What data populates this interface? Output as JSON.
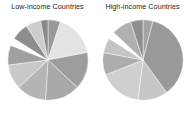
{
  "figure": {
    "background": "#ffffff",
    "text_color": "#1c1c1c"
  },
  "panels": [
    {
      "title": "Low-income Countries"
    },
    {
      "title": "High-income Countries"
    }
  ],
  "chart_data": [
    {
      "type": "pie",
      "title": "Low-income Countries",
      "xlabel": "",
      "ylabel": "",
      "legend": "none",
      "grid": false,
      "start_angle_deg": 90,
      "direction": "clockwise",
      "categories": [
        "Slice 1",
        "Slice 2",
        "Slice 3",
        "Slice 4",
        "Slice 5",
        "Slice 6",
        "Slice 7",
        "Slice 8",
        "Slice 9",
        "Slice 10",
        "Slice 11"
      ],
      "values": [
        5,
        17,
        15,
        14,
        12,
        10,
        8,
        3,
        7,
        6,
        3
      ],
      "colors": [
        "#9a9a9a",
        "#e3e3e3",
        "#9d9d9d",
        "#a9a9a9",
        "#b4b4b4",
        "#c9c9c9",
        "#a0a0a0",
        "#ffffff",
        "#8e8e8e",
        "#cdcdcd",
        "#8a8a8a"
      ]
    },
    {
      "type": "pie",
      "title": "High-income Countries",
      "xlabel": "",
      "ylabel": "",
      "legend": "none",
      "grid": false,
      "start_angle_deg": 90,
      "direction": "clockwise",
      "categories": [
        "Slice 1",
        "Slice 2",
        "Slice 3",
        "Slice 4",
        "Slice 5",
        "Slice 6",
        "Slice 7",
        "Slice 8",
        "Slice 9"
      ],
      "values": [
        4,
        36,
        12,
        17,
        9,
        6,
        3,
        8,
        5
      ],
      "colors": [
        "#a4a4a4",
        "#999999",
        "#c6c6c6",
        "#cfcfcf",
        "#adadad",
        "#c4c4c4",
        "#ffffff",
        "#b0b0b0",
        "#8f8f8f"
      ]
    }
  ]
}
